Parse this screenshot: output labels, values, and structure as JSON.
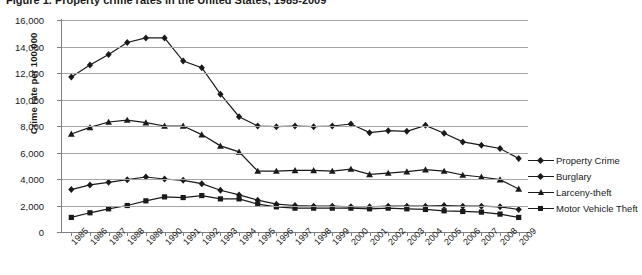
{
  "title": "Figure 1. Property crime rates in the United States, 1985-2009",
  "axes": {
    "ylabel": "Crime rate per 100,000",
    "yticks": [
      "16,000",
      "14,000",
      "12,000",
      "10,000",
      "8,000",
      "6,000",
      "4,000",
      "2,000",
      "0"
    ],
    "xticks": [
      "1985",
      "1986",
      "1987",
      "1988",
      "1989",
      "1990",
      "1991",
      "1992",
      "1993",
      "1994",
      "1995",
      "1996",
      "1997",
      "1998",
      "1999",
      "2000",
      "2001",
      "2002",
      "2003",
      "2004",
      "2005",
      "2006",
      "2007",
      "2008",
      "2009"
    ]
  },
  "legend": {
    "items": [
      {
        "label": "Property Crime",
        "marker": "diamond",
        "color": "#1a1a1a"
      },
      {
        "label": "Burglary",
        "marker": "diamond",
        "color": "#1a1a1a"
      },
      {
        "label": "Larceny-theft",
        "marker": "triangle",
        "color": "#1a1a1a"
      },
      {
        "label": "Motor Vehicle Theft",
        "marker": "square",
        "color": "#1a1a1a"
      }
    ]
  },
  "chart_data": {
    "type": "line",
    "title": "Figure 1. Property crime rates in the United States, 1985-2009",
    "xlabel": "",
    "ylabel": "Crime rate per 100,000",
    "ylim": [
      0,
      16000
    ],
    "ytick_step": 2000,
    "grid": true,
    "legend_position": "right",
    "x": [
      1985,
      1986,
      1987,
      1988,
      1989,
      1990,
      1991,
      1992,
      1993,
      1994,
      1995,
      1996,
      1997,
      1998,
      1999,
      2000,
      2001,
      2002,
      2003,
      2004,
      2005,
      2006,
      2007,
      2008,
      2009
    ],
    "series": [
      {
        "name": "Property Crime",
        "marker": "diamond",
        "color": "#1a1a1a",
        "values": [
          11700,
          12600,
          13400,
          14300,
          14650,
          14650,
          12900,
          12400,
          10400,
          8700,
          8000,
          7950,
          8000,
          7950,
          8000,
          8150,
          7500,
          7650,
          7600,
          8050,
          7450,
          6800,
          6550,
          6300,
          5550
        ]
      },
      {
        "name": "Burglary",
        "marker": "diamond",
        "color": "#1a1a1a",
        "values": [
          3200,
          3550,
          3750,
          3950,
          4150,
          4000,
          3900,
          3650,
          3150,
          2800,
          2400,
          2100,
          2000,
          1950,
          1950,
          1900,
          1900,
          1950,
          1950,
          1950,
          2000,
          1950,
          1950,
          1900,
          1700
        ]
      },
      {
        "name": "Larceny-theft",
        "marker": "triangle",
        "color": "#1a1a1a",
        "values": [
          7400,
          7900,
          8300,
          8450,
          8250,
          8000,
          8000,
          7350,
          6500,
          6050,
          4600,
          4600,
          4650,
          4650,
          4600,
          4750,
          4350,
          4450,
          4550,
          4700,
          4600,
          4300,
          4150,
          3950,
          3250
        ]
      },
      {
        "name": "Motor Vehicle Theft",
        "marker": "square",
        "color": "#1a1a1a",
        "values": [
          1100,
          1450,
          1750,
          2000,
          2350,
          2650,
          2600,
          2750,
          2500,
          2500,
          2100,
          1900,
          1800,
          1800,
          1800,
          1800,
          1750,
          1800,
          1750,
          1700,
          1600,
          1550,
          1500,
          1350,
          1100
        ]
      }
    ]
  }
}
